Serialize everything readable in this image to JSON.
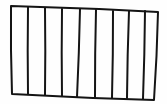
{
  "sketch": {
    "description": "Hand-drawn rectangle divided into vertical columns",
    "stroke_color": "#141414",
    "background_color": "#fefefe",
    "stroke_width": 2,
    "outline": {
      "top_left": [
        11,
        6
      ],
      "top_right": [
        158,
        12
      ],
      "bottom_right": [
        154,
        100
      ],
      "bottom_left": [
        12,
        94
      ]
    },
    "column_count": 9,
    "dividers": [
      {
        "top": [
          28,
          7
        ],
        "bottom": [
          28,
          94
        ]
      },
      {
        "top": [
          45,
          8
        ],
        "bottom": [
          45,
          95
        ]
      },
      {
        "top": [
          62,
          9
        ],
        "bottom": [
          62,
          96
        ]
      },
      {
        "top": [
          80,
          9
        ],
        "bottom": [
          77,
          97
        ]
      },
      {
        "top": [
          96,
          10
        ],
        "bottom": [
          95,
          97
        ]
      },
      {
        "top": [
          113,
          11
        ],
        "bottom": [
          112,
          98
        ]
      },
      {
        "top": [
          129,
          11
        ],
        "bottom": [
          127,
          98
        ]
      },
      {
        "top": [
          145,
          11
        ],
        "bottom": [
          143,
          99
        ]
      }
    ]
  }
}
